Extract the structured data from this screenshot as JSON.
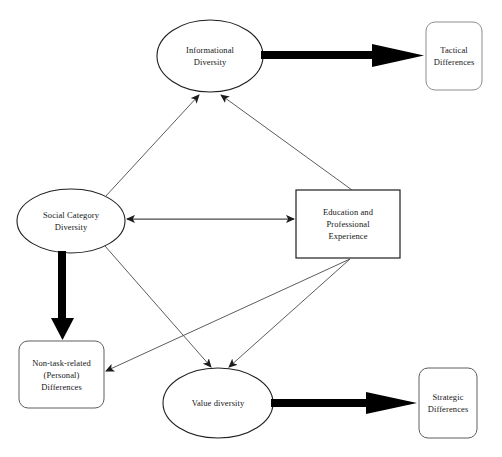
{
  "diagram": {
    "background_color": "#ffffff",
    "line_color": "#3a3a3a",
    "thick_line_color": "#000000",
    "text_color": "#161616",
    "nodes": [
      {
        "id": "informational_diversity",
        "label": "Informational\nDiversity",
        "shape": "ellipse",
        "cx": 210,
        "cy": 56,
        "rx": 53,
        "ry": 36
      },
      {
        "id": "tactical_differences",
        "label": "Tactical\nDifferences",
        "shape": "rounded-rect",
        "x": 426,
        "y": 22,
        "w": 56,
        "h": 68
      },
      {
        "id": "social_category_diversity",
        "label": "Social Category\nDiversity",
        "shape": "ellipse",
        "cx": 71,
        "cy": 221,
        "rx": 54,
        "ry": 32
      },
      {
        "id": "education_professional_experience",
        "label": "Education and\nProfessional\nExperience",
        "shape": "rect",
        "x": 296,
        "y": 190,
        "w": 104,
        "h": 68
      },
      {
        "id": "non_task_related_differences",
        "label": "Non-task-related\n(Personal)\nDifferences",
        "shape": "rounded-rect",
        "x": 19,
        "y": 341,
        "w": 85,
        "h": 67
      },
      {
        "id": "value_diversity",
        "label": "Value diversity",
        "shape": "ellipse",
        "cx": 218,
        "cy": 403,
        "rx": 55,
        "ry": 35
      },
      {
        "id": "strategic_differences",
        "label": "Strategic\nDifferences",
        "shape": "rounded-rect",
        "x": 419,
        "y": 368,
        "w": 58,
        "h": 70
      }
    ],
    "edges": [
      {
        "id": "edge-informational-to-tactical",
        "from": "informational_diversity",
        "to": "tactical_differences",
        "style": "thick",
        "arrowheads": "end"
      },
      {
        "id": "edge-social-to-informational",
        "from": "social_category_diversity",
        "to": "informational_diversity",
        "style": "thin",
        "arrowheads": "end"
      },
      {
        "id": "edge-education-to-informational",
        "from": "education_professional_experience",
        "to": "informational_diversity",
        "style": "thin",
        "arrowheads": "end"
      },
      {
        "id": "edge-social-education-bidirectional",
        "from": "social_category_diversity",
        "to": "education_professional_experience",
        "style": "thin",
        "arrowheads": "both"
      },
      {
        "id": "edge-social-to-nontask",
        "from": "social_category_diversity",
        "to": "non_task_related_differences",
        "style": "thick",
        "arrowheads": "end"
      },
      {
        "id": "edge-social-to-value",
        "from": "social_category_diversity",
        "to": "value_diversity",
        "style": "thin",
        "arrowheads": "end"
      },
      {
        "id": "edge-education-to-value",
        "from": "education_professional_experience",
        "to": "value_diversity",
        "style": "thin",
        "arrowheads": "end"
      },
      {
        "id": "edge-education-to-nontask",
        "from": "education_professional_experience",
        "to": "non_task_related_differences",
        "style": "thin",
        "arrowheads": "end"
      },
      {
        "id": "edge-value-to-strategic",
        "from": "value_diversity",
        "to": "strategic_differences",
        "style": "thick",
        "arrowheads": "end"
      }
    ]
  }
}
